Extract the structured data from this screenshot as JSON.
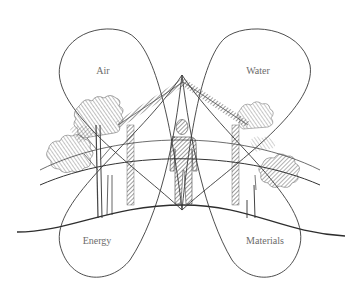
{
  "diagram": {
    "type": "illustration",
    "loops": [
      {
        "id": "air",
        "label": "Air",
        "position": "top-left",
        "label_x": 103,
        "label_y": 70
      },
      {
        "id": "water",
        "label": "Water",
        "position": "top-right",
        "label_x": 258,
        "label_y": 70
      },
      {
        "id": "energy",
        "label": "Energy",
        "position": "bottom-left",
        "label_x": 97,
        "label_y": 240
      },
      {
        "id": "materials",
        "label": "Materials",
        "position": "bottom-right",
        "label_x": 265,
        "label_y": 240
      }
    ],
    "center_elements": [
      "house",
      "person",
      "trees-left",
      "trees-right",
      "ground-hill"
    ],
    "colors": {
      "background": "#ffffff",
      "line": "#3a3a3a",
      "hatch": "#555555",
      "label": "#6b6b6b"
    }
  }
}
